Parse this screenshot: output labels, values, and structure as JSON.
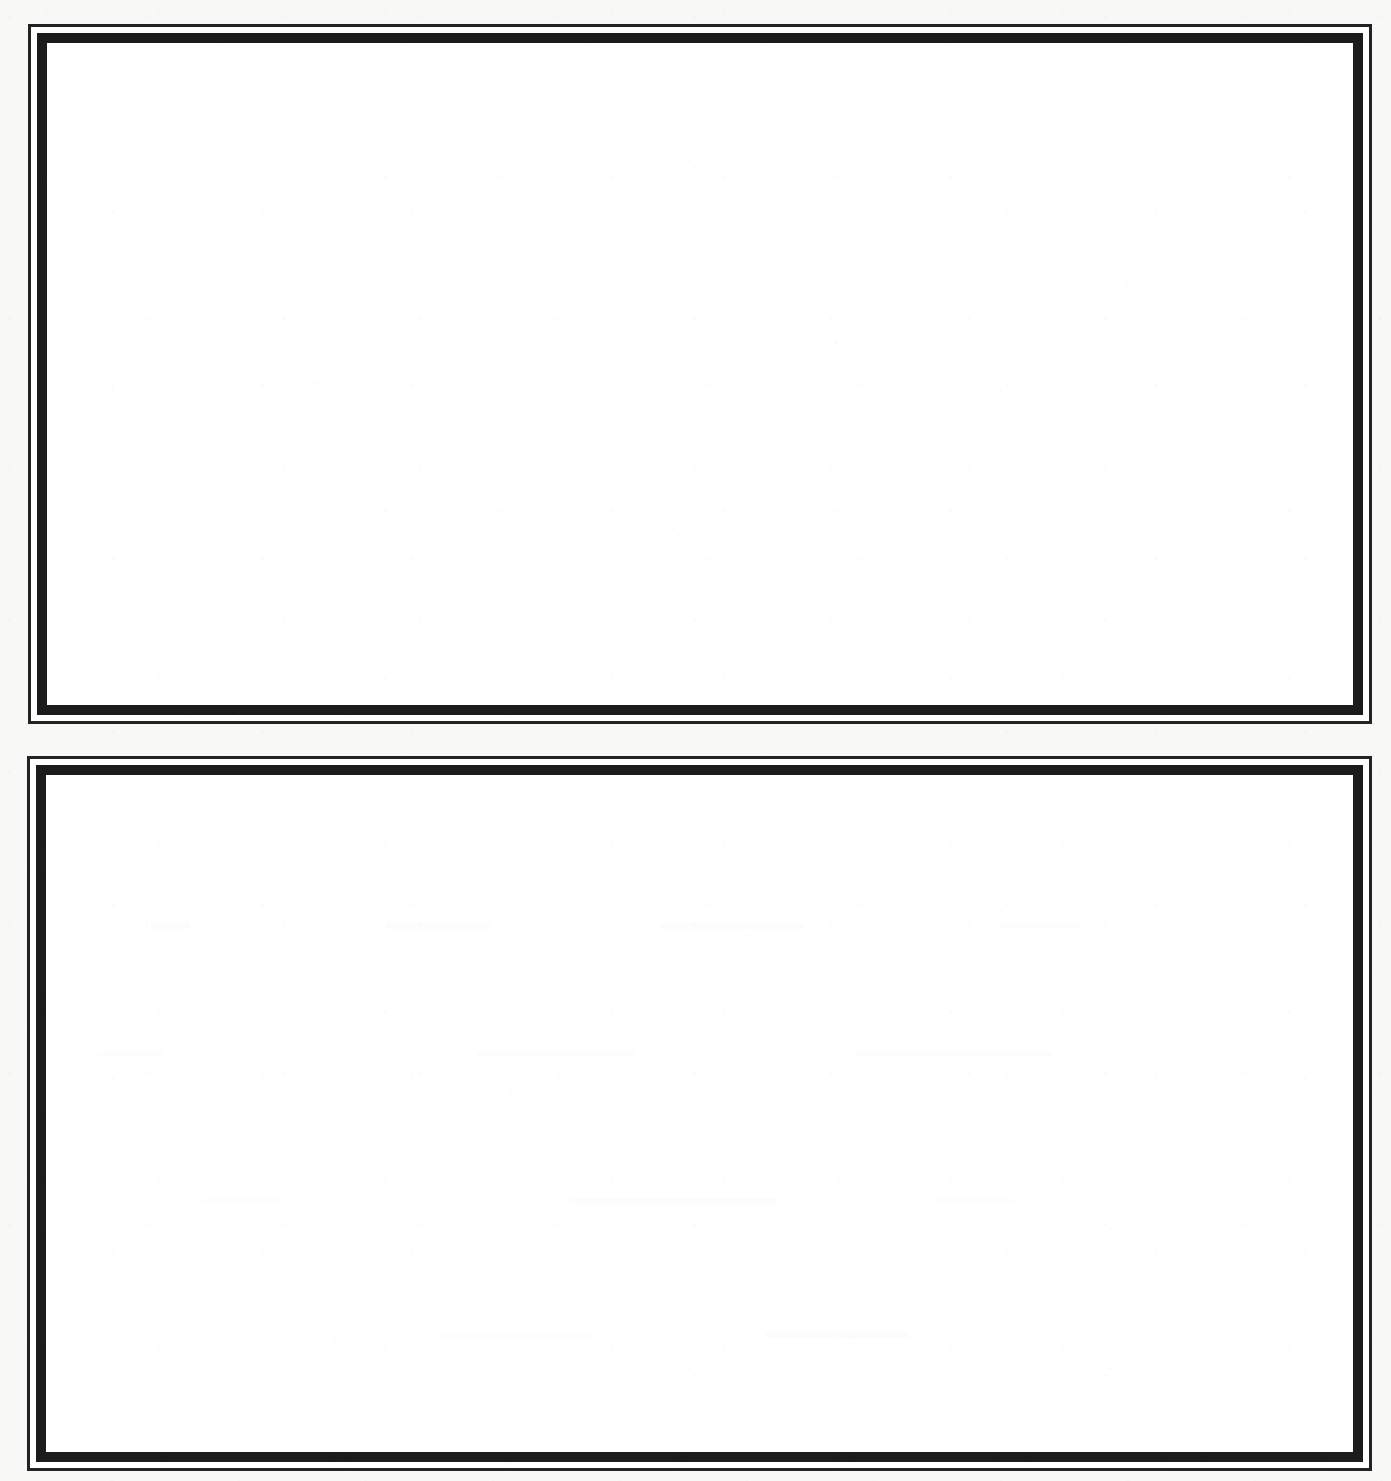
{
  "document": {
    "kind": "scanned-page",
    "title": "Blank bordered form page",
    "page_width": 1391,
    "page_height": 1481,
    "background_color": "#f8f8f7",
    "paper_color": "#ffffff",
    "ink_color": "#1c1c1c",
    "frame_count": 2
  },
  "frames": [
    {
      "id": "frame-top",
      "label": "Upper bordered panel",
      "border_style": "double-rule",
      "outer_rule_thickness_px": 3,
      "inner_rule_thickness_px": 10,
      "gap_px": 6,
      "x": 28,
      "y": 24,
      "width": 1344,
      "height": 700,
      "content": "",
      "content_placeholder": "",
      "has_ghost_marks": false
    },
    {
      "id": "frame-bottom",
      "label": "Lower bordered panel",
      "border_style": "double-rule",
      "outer_rule_thickness_px": 3,
      "inner_rule_thickness_px": 10,
      "gap_px": 6,
      "x": 27,
      "y": 756,
      "width": 1345,
      "height": 715,
      "content": "",
      "content_placeholder": "",
      "has_ghost_marks": true
    }
  ]
}
